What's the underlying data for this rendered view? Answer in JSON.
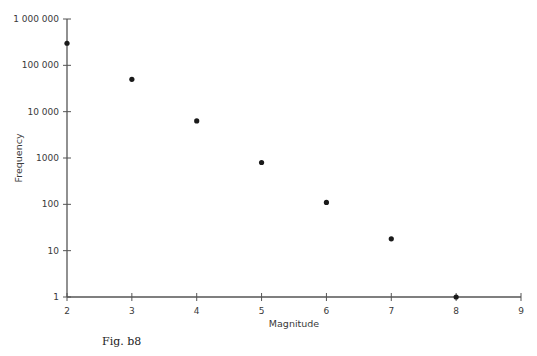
{
  "chart_data": {
    "type": "scatter",
    "title": "",
    "xlabel": "Magnitude",
    "ylabel": "Frequency",
    "x_ticks": [
      2,
      3,
      4,
      5,
      6,
      7,
      8,
      9
    ],
    "y_ticks": [
      1,
      10,
      100,
      1000,
      10000,
      100000,
      1000000
    ],
    "y_tick_labels": [
      "1",
      "10",
      "100",
      "1000",
      "10 000",
      "100 000",
      "1 000 000"
    ],
    "y_scale": "log",
    "xlim": [
      2,
      9
    ],
    "ylim": [
      1,
      1000000
    ],
    "grid": false,
    "legend": null,
    "series": [
      {
        "name": "Frequency",
        "x": [
          2,
          3,
          4,
          5,
          6,
          7,
          8
        ],
        "y": [
          300000,
          50000,
          6300,
          800,
          110,
          18,
          1
        ]
      }
    ],
    "marker_color": "#1a1a1a",
    "axis_color": "#555555"
  },
  "caption": "Fig. b8"
}
